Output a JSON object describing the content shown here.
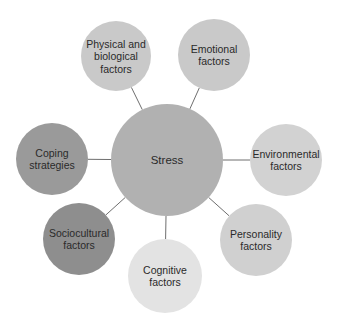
{
  "diagram": {
    "type": "hub-and-spoke",
    "center": {
      "label": "Stress",
      "cx": 167,
      "cy": 160,
      "r": 56,
      "color": "#b1b1b1"
    },
    "nodes": [
      {
        "id": "physical",
        "lines": [
          "Physical and",
          "biological",
          "factors"
        ],
        "cx": 116,
        "cy": 56,
        "r": 35,
        "color": "#c9c9c9"
      },
      {
        "id": "emotional",
        "lines": [
          "Emotional",
          "factors"
        ],
        "cx": 214,
        "cy": 55,
        "r": 36,
        "color": "#c9c9c9"
      },
      {
        "id": "environmental",
        "lines": [
          "Environmental",
          "factors"
        ],
        "cx": 286,
        "cy": 160,
        "r": 36,
        "color": "#d2d2d2"
      },
      {
        "id": "personality",
        "lines": [
          "Personality",
          "factors"
        ],
        "cx": 256,
        "cy": 240,
        "r": 36,
        "color": "#d0d0d0"
      },
      {
        "id": "cognitive",
        "lines": [
          "Cognitive",
          "factors"
        ],
        "cx": 165,
        "cy": 276,
        "r": 37,
        "color": "#e3e3e3"
      },
      {
        "id": "sociocultural",
        "lines": [
          "Sociocultural",
          "factors"
        ],
        "cx": 79,
        "cy": 239,
        "r": 36,
        "color": "#8e8e8e"
      },
      {
        "id": "coping",
        "lines": [
          "Coping",
          "strategies"
        ],
        "cx": 52,
        "cy": 159,
        "r": 36,
        "color": "#9a9a9a"
      }
    ],
    "connector_color": "#6e6e6e"
  }
}
